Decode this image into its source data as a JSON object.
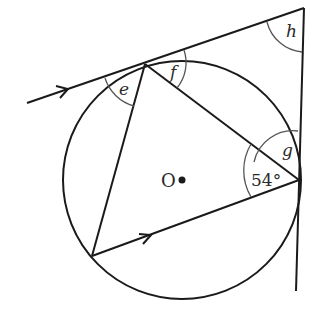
{
  "diagram": {
    "type": "circle-theorem",
    "center_label": "O",
    "angle_labels": {
      "e": "e",
      "f": "f",
      "g": "g",
      "h": "h",
      "given": "54°"
    },
    "given_angle_degrees": 54,
    "elements": [
      "circle with centre O",
      "inscribed triangle",
      "tangent line at top vertex (with arrow)",
      "tangent line at right vertex (vertical)",
      "side of triangle parallel to tangent (with arrow)"
    ],
    "colors": {
      "stroke": "#1a1a1a",
      "arc": "#555555"
    }
  }
}
